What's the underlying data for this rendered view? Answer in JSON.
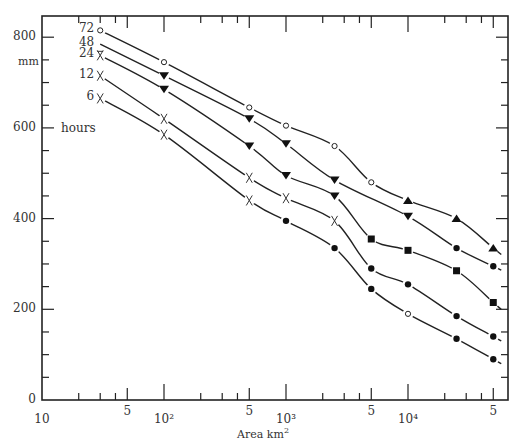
{
  "chart_data": {
    "type": "line",
    "title": "",
    "xlabel": "Area km²",
    "ylabel": "mm",
    "x_scale": "log",
    "xlim": [
      10,
      60000
    ],
    "ylim": [
      0,
      850
    ],
    "x_tick_labels": [
      "10",
      "5",
      "10²",
      "5",
      "10³",
      "5",
      "10⁴",
      "5"
    ],
    "x_tick_values": [
      10,
      50,
      100,
      500,
      1000,
      5000,
      10000,
      50000
    ],
    "y_tick_labels": [
      "0",
      "200",
      "400",
      "600",
      "800"
    ],
    "y_tick_values": [
      0,
      200,
      400,
      600,
      800
    ],
    "y_minor_step": 50,
    "legend_title": "hours",
    "series": [
      {
        "name": "72",
        "points": [
          [
            30,
            815
          ],
          [
            100,
            745
          ],
          [
            500,
            645
          ],
          [
            1000,
            605
          ],
          [
            2500,
            560
          ],
          [
            5000,
            480
          ],
          [
            10000,
            440
          ],
          [
            25000,
            400
          ],
          [
            50000,
            335
          ]
        ],
        "markers": [
          "circle-open",
          "circle-open",
          "circle-open",
          "circle-open",
          "circle-open",
          "circle-open",
          "triangle-up",
          "triangle-up",
          "triangle-up"
        ]
      },
      {
        "name": "48",
        "points": [
          [
            30,
            785
          ],
          [
            100,
            715
          ],
          [
            500,
            620
          ],
          [
            1000,
            565
          ],
          [
            2500,
            485
          ],
          [
            10000,
            405
          ],
          [
            25000,
            335
          ],
          [
            50000,
            295
          ]
        ],
        "markers": [
          "none",
          "triangle-down",
          "triangle-down",
          "triangle-down",
          "triangle-down",
          "triangle-down",
          "circle",
          "circle"
        ]
      },
      {
        "name": "24",
        "points": [
          [
            30,
            760
          ],
          [
            100,
            685
          ],
          [
            500,
            560
          ],
          [
            1000,
            495
          ],
          [
            2500,
            450
          ],
          [
            5000,
            355
          ],
          [
            10000,
            330
          ],
          [
            25000,
            285
          ],
          [
            50000,
            215
          ]
        ],
        "markers": [
          "x-open",
          "triangle-down",
          "triangle-down",
          "triangle-down",
          "triangle-down",
          "square",
          "square",
          "square",
          "square"
        ]
      },
      {
        "name": "12",
        "points": [
          [
            30,
            715
          ],
          [
            100,
            620
          ],
          [
            500,
            490
          ],
          [
            1000,
            445
          ],
          [
            2500,
            395
          ],
          [
            5000,
            290
          ],
          [
            10000,
            255
          ],
          [
            25000,
            185
          ],
          [
            50000,
            140
          ]
        ],
        "markers": [
          "x",
          "x",
          "x",
          "x",
          "x",
          "circle",
          "circle",
          "circle",
          "circle"
        ]
      },
      {
        "name": "6",
        "points": [
          [
            30,
            665
          ],
          [
            100,
            585
          ],
          [
            500,
            440
          ],
          [
            1000,
            395
          ],
          [
            2500,
            335
          ],
          [
            5000,
            245
          ],
          [
            10000,
            190
          ],
          [
            25000,
            135
          ],
          [
            50000,
            90
          ]
        ],
        "markers": [
          "x",
          "x",
          "x",
          "circle",
          "circle",
          "circle",
          "circle-open",
          "circle",
          "circle"
        ]
      }
    ],
    "grid": false,
    "legend_position": "inline-left"
  },
  "labels": {
    "y_unit": "mm",
    "legend_title": "hours",
    "x_axis_title": "Area km",
    "x_axis_sup": "2"
  }
}
